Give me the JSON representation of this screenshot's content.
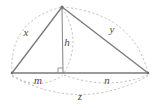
{
  "figure": {
    "kind": "geometry-diagram",
    "colors": {
      "background": "#ffffff",
      "solid_line": "#7a7a7a",
      "altitude_line": "#8d8d8d",
      "dashed_arc": "#b4b4b4",
      "label_text": "#4a4a4a"
    },
    "vertices": {
      "apex": {
        "name": "apex-vertex",
        "x": 62,
        "y": 7
      },
      "left": {
        "name": "left-base-vertex",
        "x": 12,
        "y": 73
      },
      "right": {
        "name": "right-base-vertex",
        "x": 148,
        "y": 73
      },
      "foot": {
        "name": "altitude-foot",
        "x": 63,
        "y": 73
      }
    },
    "edges": [
      {
        "name": "left-side",
        "label": "x",
        "from": "left",
        "to": "apex"
      },
      {
        "name": "right-side",
        "label": "y",
        "from": "apex",
        "to": "right"
      },
      {
        "name": "base",
        "label": "z",
        "from": "left",
        "to": "right"
      },
      {
        "name": "altitude",
        "label": "h",
        "from": "apex",
        "to": "foot"
      },
      {
        "name": "base-left-segment",
        "label": "m",
        "from": "left",
        "to": "foot"
      },
      {
        "name": "base-right-segment",
        "label": "n",
        "from": "foot",
        "to": "right"
      }
    ],
    "labels": {
      "x": {
        "text": "x",
        "x": 26,
        "y": 33
      },
      "y": {
        "text": "y",
        "x": 112,
        "y": 30
      },
      "h": {
        "text": "h",
        "x": 67,
        "y": 43
      },
      "m": {
        "text": "m",
        "x": 38,
        "y": 81
      },
      "n": {
        "text": "n",
        "x": 107,
        "y": 81
      },
      "z": {
        "text": "z",
        "x": 80,
        "y": 97
      }
    },
    "arcs": [
      {
        "name": "arc-x",
        "for_label": "x",
        "path": "M 12 73 Q 10 20 62 7"
      },
      {
        "name": "arc-y",
        "for_label": "y",
        "path": "M 62 7 Q 132 14 148 73"
      },
      {
        "name": "arc-h",
        "for_label": "h",
        "path": "M 62 7 Q 82 40 63 73"
      },
      {
        "name": "arc-m",
        "for_label": "m",
        "path": "M 12 73 Q 38 91 63 74"
      },
      {
        "name": "arc-n",
        "for_label": "n",
        "path": "M 63 74 Q 108 90 148 73"
      },
      {
        "name": "arc-z",
        "for_label": "z",
        "path": "M 12 74 Q 80 112 148 74"
      }
    ],
    "right_angle": {
      "name": "right-angle-marker",
      "x": 63,
      "y": 73,
      "size": 5
    }
  }
}
